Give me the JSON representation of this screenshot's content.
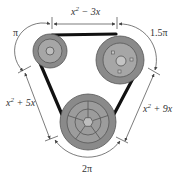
{
  "diagram": {
    "type": "belt-and-pulley",
    "colors": {
      "background": "#ffffff",
      "belt": "#111111",
      "pulley_fill": "#8a8a8a",
      "pulley_inner": "#a6a6a6",
      "hub": "#c4c4c4",
      "dimension_line": "#444444",
      "label": "#333333"
    },
    "pulleys": [
      {
        "id": "small-pulley",
        "position": "top-left",
        "detail": "concentric rings"
      },
      {
        "id": "large-pulley",
        "position": "top-right",
        "detail": "hub with 3 bolt holes"
      },
      {
        "id": "bottom-pulley",
        "position": "bottom",
        "detail": "spoked wheel with hexagonal hub"
      }
    ],
    "labels": {
      "top_straight": {
        "base": "x",
        "exp": "2",
        "rest": " − 3x"
      },
      "left_straight": {
        "base": "x",
        "exp": "2",
        "rest": " + 5x"
      },
      "right_straight": {
        "base": "x",
        "exp": "2",
        "rest": " + 9x"
      },
      "arc_small": "π",
      "arc_large": "1.5π",
      "arc_bottom": "2π"
    }
  }
}
